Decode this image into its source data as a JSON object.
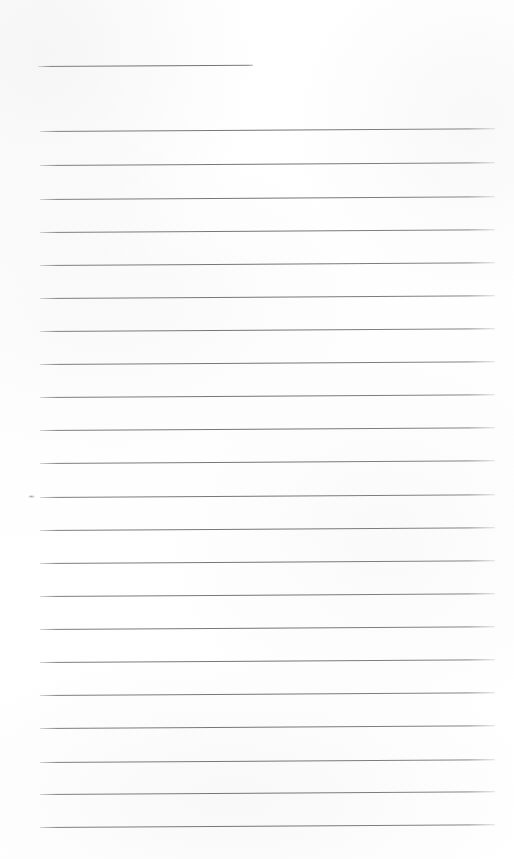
{
  "document": {
    "kind": "scanned-lined-paper",
    "title": "Blank ruled notebook page",
    "page_width": 514,
    "page_height": 859,
    "background_color": "#ffffff",
    "rule_color": "#74747a",
    "written_text": "",
    "line_count": 23
  },
  "ruling": {
    "left_margin_x": 40,
    "right_margin_x": 495,
    "first_line_y": 66,
    "line_spacing": 33.5,
    "tilt_degrees": -0.35,
    "stroke_width_px": 1
  },
  "lines": [
    {
      "id": "line-01",
      "y": 66,
      "x": 38,
      "width": 215,
      "partial": true
    },
    {
      "id": "line-02",
      "y": 131,
      "x": 40,
      "width": 455,
      "partial": false
    },
    {
      "id": "line-03",
      "y": 165,
      "x": 40,
      "width": 455,
      "partial": false
    },
    {
      "id": "line-04",
      "y": 199,
      "x": 40,
      "width": 455,
      "partial": false
    },
    {
      "id": "line-05",
      "y": 232,
      "x": 40,
      "width": 455,
      "partial": false
    },
    {
      "id": "line-06",
      "y": 265,
      "x": 40,
      "width": 455,
      "partial": false
    },
    {
      "id": "line-07",
      "y": 298,
      "x": 40,
      "width": 455,
      "partial": false
    },
    {
      "id": "line-08",
      "y": 331,
      "x": 40,
      "width": 455,
      "partial": false
    },
    {
      "id": "line-09",
      "y": 364,
      "x": 40,
      "width": 455,
      "partial": false
    },
    {
      "id": "line-10",
      "y": 397,
      "x": 40,
      "width": 455,
      "partial": false
    },
    {
      "id": "line-11",
      "y": 430,
      "x": 40,
      "width": 455,
      "partial": false
    },
    {
      "id": "line-12",
      "y": 463,
      "x": 40,
      "width": 455,
      "partial": false
    },
    {
      "id": "line-13",
      "y": 497,
      "x": 40,
      "width": 455,
      "partial": false
    },
    {
      "id": "line-14",
      "y": 530,
      "x": 40,
      "width": 455,
      "partial": false
    },
    {
      "id": "line-15",
      "y": 563,
      "x": 40,
      "width": 455,
      "partial": false
    },
    {
      "id": "line-16",
      "y": 596,
      "x": 40,
      "width": 455,
      "partial": false
    },
    {
      "id": "line-17",
      "y": 629,
      "x": 40,
      "width": 455,
      "partial": false
    },
    {
      "id": "line-18",
      "y": 662,
      "x": 40,
      "width": 455,
      "partial": false
    },
    {
      "id": "line-19",
      "y": 695,
      "x": 40,
      "width": 455,
      "partial": false
    },
    {
      "id": "line-20",
      "y": 728,
      "x": 40,
      "width": 455,
      "partial": false
    },
    {
      "id": "line-21",
      "y": 762,
      "x": 40,
      "width": 455,
      "partial": false
    },
    {
      "id": "line-22",
      "y": 794,
      "x": 40,
      "width": 455,
      "partial": false
    },
    {
      "id": "line-23",
      "y": 827,
      "x": 40,
      "width": 455,
      "partial": false
    }
  ],
  "artifacts": [
    {
      "id": "speck-left-margin",
      "name": "scan-speck",
      "x": 28,
      "y": 495,
      "width": 7,
      "height": 3
    }
  ]
}
